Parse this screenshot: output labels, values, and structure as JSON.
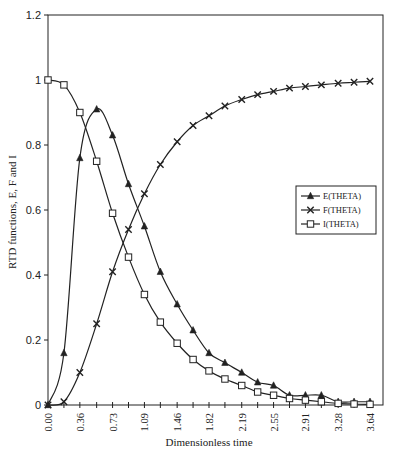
{
  "chart_data": {
    "type": "line",
    "title": "",
    "xlabel": "Dimensionless time",
    "ylabel": "RTD functions, E, F and I",
    "ylim": [
      0,
      1.2
    ],
    "xlim": [
      0,
      3.64
    ],
    "yticks": [
      "0",
      "0.2",
      "0.4",
      "0.6",
      "0.8",
      "1",
      "1.2"
    ],
    "xtick_labels": [
      "0.00",
      "0.36",
      "0.73",
      "1.09",
      "1.46",
      "1.82",
      "2.19",
      "2.55",
      "2.91",
      "3.28",
      "3.64"
    ],
    "grid": false,
    "legend_position": "right-middle inside plot",
    "x": [
      0.0,
      0.18,
      0.36,
      0.55,
      0.73,
      0.91,
      1.09,
      1.27,
      1.46,
      1.64,
      1.82,
      2.0,
      2.19,
      2.37,
      2.55,
      2.73,
      2.91,
      3.09,
      3.28,
      3.46,
      3.64
    ],
    "series": [
      {
        "name": "E(THETA)",
        "marker": "triangle",
        "values": [
          0.0,
          0.16,
          0.76,
          0.91,
          0.83,
          0.68,
          0.55,
          0.41,
          0.31,
          0.23,
          0.16,
          0.13,
          0.1,
          0.07,
          0.06,
          0.03,
          0.03,
          0.03,
          0.01,
          0.01,
          0.01
        ]
      },
      {
        "name": "F(THETA)",
        "marker": "x",
        "values": [
          0.0,
          0.01,
          0.1,
          0.25,
          0.41,
          0.54,
          0.65,
          0.74,
          0.81,
          0.86,
          0.89,
          0.92,
          0.94,
          0.955,
          0.965,
          0.975,
          0.98,
          0.985,
          0.99,
          0.993,
          0.996
        ]
      },
      {
        "name": "I(THETA)",
        "marker": "square",
        "values": [
          1.0,
          0.985,
          0.9,
          0.75,
          0.59,
          0.455,
          0.34,
          0.255,
          0.19,
          0.14,
          0.105,
          0.08,
          0.06,
          0.04,
          0.03,
          0.02,
          0.015,
          0.01,
          0.005,
          0.003,
          0.002
        ]
      }
    ]
  },
  "colors": {
    "line": "#222222",
    "frame": "#222222",
    "background": "#ffffff"
  }
}
